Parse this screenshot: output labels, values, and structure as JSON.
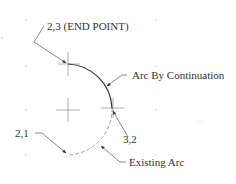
{
  "diagram": {
    "type": "cad-arc-continuation",
    "colors": {
      "background": "#ffffff",
      "arc_solid": "#333333",
      "arc_dashed": "#9a9a9a",
      "leader": "#6a6a6a",
      "cross": "#9a9a9a",
      "text": "#333333",
      "grid_dot": "#d0d0d0"
    },
    "labels": {
      "end_point": "2,3 (END POINT)",
      "arc_by_continuation": "Arc By Continuation",
      "point_3_2": "3,2",
      "point_2_1": "2,1",
      "existing_arc": "Existing Arc"
    },
    "points": {
      "end_point": {
        "label": "2,3",
        "x": 68,
        "y": 64
      },
      "center": {
        "x": 68,
        "y": 110
      },
      "point_3_2": {
        "label": "3,2",
        "x": 113,
        "y": 108
      },
      "point_2_1": {
        "label": "2,1",
        "x": 68,
        "y": 154
      }
    },
    "arcs": [
      {
        "name": "arc-by-continuation",
        "style": "solid",
        "from": "3,2",
        "to": "2,3"
      },
      {
        "name": "existing-arc",
        "style": "dashed",
        "from": "2,1",
        "to": "3,2"
      }
    ]
  }
}
